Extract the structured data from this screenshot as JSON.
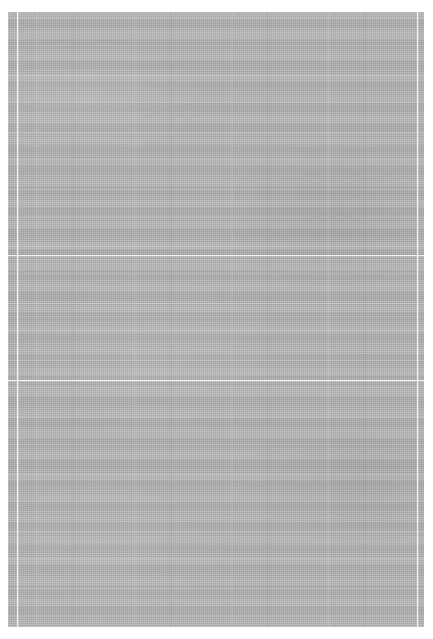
{
  "image": {
    "subject": "gray woven linen fabric swatch",
    "canvas_width_px": 433,
    "canvas_height_px": 639,
    "background_color": "#ffffff",
    "text_content": "",
    "ui_controls": "none"
  },
  "swatch": {
    "name": "fabric-swatch",
    "left_px": 8,
    "top_px": 12,
    "width_px": 416,
    "height_px": 615,
    "base_color": "#a9a9a9",
    "weave_light_color": "#b8b8b8",
    "weave_dark_color": "#9e9e9e",
    "seam_color": "#f2f2f2",
    "weave_type": "plain-weave-linen",
    "warp_pitch_px": 2,
    "weft_pitch_px": 2.1
  },
  "seams": {
    "horizontal": [
      {
        "name": "seam-line-upper",
        "y_px": 243
      },
      {
        "name": "seam-line-lower",
        "y_px": 368
      }
    ],
    "vertical": [
      {
        "name": "seam-line-left",
        "x_px": 9
      },
      {
        "name": "seam-line-right",
        "x_px": 409
      }
    ]
  }
}
